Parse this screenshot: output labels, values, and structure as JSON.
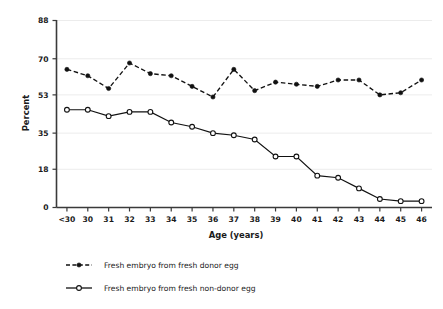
{
  "chart_data": {
    "type": "line",
    "title": "",
    "xlabel": "Age (years)",
    "ylabel": "Percent",
    "categories": [
      "<30",
      "30",
      "31",
      "32",
      "33",
      "34",
      "35",
      "36",
      "37",
      "38",
      "39",
      "40",
      "41",
      "42",
      "43",
      "44",
      "45",
      "46"
    ],
    "yticks": [
      0,
      18,
      35,
      53,
      70,
      88
    ],
    "ylim": [
      0,
      88
    ],
    "grid": true,
    "legend_position": "bottom-left",
    "series": [
      {
        "name": "Fresh embryo from fresh donor egg",
        "marker": "filled-circle",
        "linestyle": "dashed",
        "values": [
          65,
          62,
          56,
          68,
          63,
          62,
          57,
          52,
          65,
          55,
          59,
          58,
          57,
          60,
          60,
          53,
          54,
          60
        ]
      },
      {
        "name": "Fresh embryo from fresh non-donor egg",
        "marker": "open-circle",
        "linestyle": "solid",
        "values": [
          46,
          46,
          43,
          45,
          45,
          40,
          38,
          35,
          34,
          32,
          24,
          24,
          15,
          14,
          9,
          4,
          3,
          3
        ]
      }
    ]
  },
  "legend": {
    "items": [
      {
        "label": "Fresh embryo from fresh donor egg",
        "style": "dashed-filled"
      },
      {
        "label": "Fresh embryo from fresh non-donor egg",
        "style": "solid-open"
      }
    ]
  },
  "axes": {
    "y_title": "Percent",
    "x_title": "Age (years)"
  }
}
